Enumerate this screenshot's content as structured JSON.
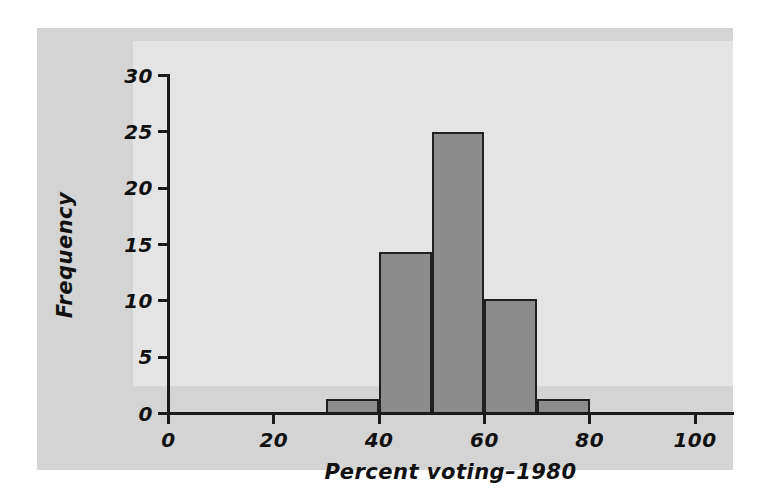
{
  "figure": {
    "background_color": "#ffffff",
    "panel_color": "#d4d4d4",
    "plot_background_color": "#e4e4e4",
    "bar_fill_color": "#8c8c8c",
    "bar_edge_color": "#1f1f1f",
    "axis_color": "#1a1a1a"
  },
  "chart_data": {
    "type": "bar",
    "title": "",
    "subtitle": "",
    "xlabel": "Percent voting–1980",
    "ylabel": "Frequency",
    "xlim": [
      0,
      100
    ],
    "ylim": [
      0,
      30
    ],
    "xticks": [
      0,
      20,
      40,
      60,
      80,
      100
    ],
    "yticks": [
      0,
      5,
      10,
      15,
      20,
      25,
      30
    ],
    "xtick_labels": [
      "0",
      "20",
      "40",
      "60",
      "80",
      "100"
    ],
    "ytick_labels": [
      "0",
      "5",
      "10",
      "15",
      "20",
      "25",
      "30"
    ],
    "grid": false,
    "legend": false,
    "legend_position": "none",
    "bin_width": 10,
    "bin_edges": [
      30,
      40,
      50,
      60,
      70,
      80
    ],
    "categories": [
      "30–40",
      "40–50",
      "50–60",
      "60–70",
      "70–80"
    ],
    "values": [
      1.3,
      14.3,
      25,
      10.2,
      1.3
    ],
    "bars": [
      {
        "label": "30–40",
        "x0": 30,
        "x1": 40,
        "value": 1.3
      },
      {
        "label": "40–50",
        "x0": 40,
        "x1": 50,
        "value": 14.3
      },
      {
        "label": "50–60",
        "x0": 50,
        "x1": 60,
        "value": 25
      },
      {
        "label": "60–70",
        "x0": 60,
        "x1": 70,
        "value": 10.2
      },
      {
        "label": "70–80",
        "x0": 70,
        "x1": 80,
        "value": 1.3
      }
    ]
  }
}
